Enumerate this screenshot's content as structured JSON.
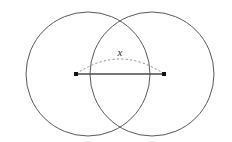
{
  "figure": {
    "canvas": {
      "width": 232,
      "height": 142,
      "background": "#ffffff"
    },
    "labels": {
      "x_label": "x"
    },
    "label_positions": {
      "x_label": {
        "x": 120,
        "y": 52
      }
    },
    "colors": {
      "circle_stroke": "#5a5a5a",
      "chord_stroke": "#4a4a4a",
      "arc_stroke": "#8e8e8e",
      "dot_fill": "#111111",
      "background": "#ffffff"
    },
    "circles": [
      {
        "name": "left-circle",
        "cx": 88,
        "cy": 74,
        "r": 62
      },
      {
        "name": "right-circle",
        "cx": 152,
        "cy": 74,
        "r": 62
      }
    ],
    "points": [
      {
        "name": "left-point",
        "x": 76,
        "y": 74,
        "size": 4
      },
      {
        "name": "right-point",
        "x": 164,
        "y": 74,
        "size": 4
      }
    ],
    "chord": {
      "x1": 76,
      "y1": 74,
      "x2": 164,
      "y2": 74
    },
    "arc": {
      "start_x": 76,
      "start_y": 74,
      "end_x": 164,
      "end_y": 74,
      "control_x": 120,
      "control_y": 44,
      "apex_y": 58
    }
  },
  "chart_data": {
    "type": "diagram",
    "shapes": [
      {
        "kind": "circle",
        "label": "left circle",
        "center": [
          88,
          74
        ],
        "radius": 62
      },
      {
        "kind": "circle",
        "label": "right circle",
        "center": [
          152,
          74
        ],
        "radius": 62
      },
      {
        "kind": "point",
        "label": "left marked point",
        "at": [
          76,
          74
        ]
      },
      {
        "kind": "point",
        "label": "right marked point",
        "at": [
          164,
          74
        ]
      },
      {
        "kind": "segment",
        "label": "solid chord between points",
        "from": [
          76,
          74
        ],
        "to": [
          164,
          74
        ]
      },
      {
        "kind": "arc",
        "label": "dashed arc above chord labeled x",
        "from": [
          76,
          74
        ],
        "to": [
          164,
          74
        ],
        "apex": [
          120,
          58
        ]
      }
    ],
    "annotations": [
      {
        "text": "x",
        "at": [
          120,
          52
        ]
      }
    ],
    "grid": false,
    "legend": false
  }
}
